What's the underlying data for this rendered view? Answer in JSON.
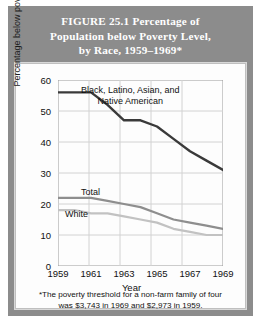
{
  "figure": {
    "title_lines": [
      "FIGURE 25.1   Percentage of",
      "Population below Poverty Level,",
      "by Race, 1959–1969*"
    ],
    "footnote_lines": [
      "*The poverty threshold for a non-farm family of four",
      "was  $3,743 in 1969 and $2,973 in 1959."
    ],
    "colors": {
      "plate": "#8c8c8c",
      "title_text": "#ffffff",
      "card": "#fdfdfd",
      "grid": "#cfcfcf",
      "minority_line": "#3a3a3a",
      "total_line": "#8e8e8e",
      "white_line": "#c2c2c2"
    }
  },
  "chart_data": {
    "type": "line",
    "title": "Percentage of Population below Poverty Level, by Race, 1959–1969",
    "xlabel": "Year",
    "ylabel": "Percentage below poverty level",
    "xlim": [
      1959,
      1969
    ],
    "ylim": [
      0,
      60
    ],
    "xticks": [
      "1959",
      "1961",
      "1963",
      "1965",
      "1967",
      "1969"
    ],
    "yticks": [
      "0",
      "10",
      "20",
      "30",
      "40",
      "50",
      "60"
    ],
    "grid": true,
    "legend": "inline-labels",
    "x": [
      1959,
      1960,
      1961,
      1962,
      1963,
      1964,
      1965,
      1966,
      1967,
      1968,
      1969
    ],
    "series": [
      {
        "name": "Black, Latino, Asian, and Native American",
        "label": "Black, Latino, Asian, and\nNative American",
        "color": "#3a3a3a",
        "values": [
          56,
          56,
          56,
          52,
          47,
          47,
          45,
          41,
          37,
          34,
          31
        ]
      },
      {
        "name": "Total",
        "label": "Total",
        "color": "#8e8e8e",
        "values": [
          22,
          22,
          22,
          21,
          20,
          19,
          17,
          15,
          14,
          13,
          12
        ]
      },
      {
        "name": "White",
        "label": "White",
        "color": "#c2c2c2",
        "values": [
          18,
          18,
          17,
          17,
          16,
          15,
          14,
          12,
          11,
          10,
          10
        ]
      }
    ]
  }
}
